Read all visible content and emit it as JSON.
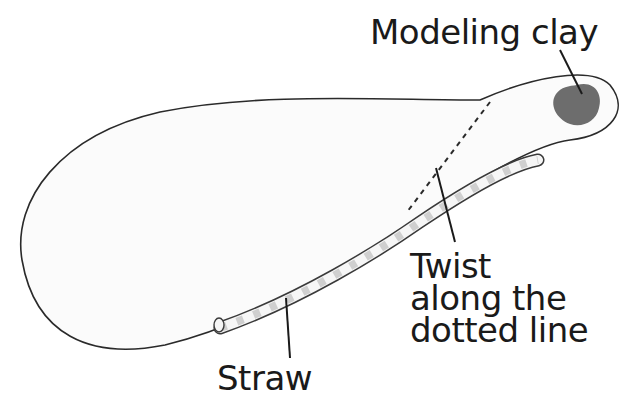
{
  "diagram": {
    "type": "labeled-illustration",
    "labels": {
      "modeling_clay": "Modeling clay",
      "twist_line1": "Twist",
      "twist_line2": "along the",
      "twist_line3": "dotted line",
      "straw": "Straw"
    },
    "colors": {
      "outline": "#2a2a2a",
      "paper_fill": "#fbfbfb",
      "clay": "#6d6d6d",
      "straw_stripe": "#cfcfcf",
      "text": "#1a1a1a"
    }
  }
}
